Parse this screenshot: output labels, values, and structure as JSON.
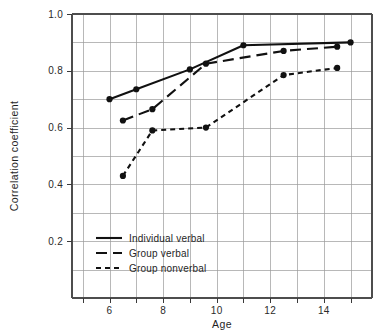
{
  "chart_data": {
    "type": "line",
    "title": "",
    "xlabel": "Age",
    "ylabel": "Correlation coefficient",
    "xlim": [
      4.6,
      15.8
    ],
    "ylim": [
      0.0,
      1.0
    ],
    "grid": true,
    "x_major_ticks": [
      6,
      8,
      10,
      12,
      14
    ],
    "x_major_tick_labels": [
      "6",
      "8",
      "10",
      "12",
      "14"
    ],
    "x_gridlines": [
      5,
      6,
      7,
      8,
      9,
      10,
      11,
      12,
      13,
      14,
      15
    ],
    "y_major_ticks": [
      0.2,
      0.4,
      0.6,
      0.8,
      1.0
    ],
    "y_major_tick_labels": [
      "0.2",
      "0.4",
      "0.6",
      "0.8",
      "1.0"
    ],
    "y_gridlines": [
      0.1,
      0.2,
      0.3,
      0.4,
      0.5,
      0.6,
      0.7,
      0.8,
      0.9,
      1.0
    ],
    "legend_position": "lower left",
    "series": [
      {
        "name": "Individual verbal",
        "style": "solid",
        "x": [
          6.0,
          7.0,
          9.0,
          11.0,
          15.0
        ],
        "y": [
          0.7,
          0.735,
          0.805,
          0.89,
          0.9
        ]
      },
      {
        "name": "Group verbal",
        "style": "long-dash",
        "x": [
          6.5,
          7.6,
          9.6,
          12.5,
          14.5
        ],
        "y": [
          0.625,
          0.665,
          0.825,
          0.87,
          0.885
        ]
      },
      {
        "name": "Group nonverbal",
        "style": "short-dash",
        "x": [
          6.5,
          7.6,
          9.6,
          12.5,
          14.5
        ],
        "y": [
          0.43,
          0.59,
          0.6,
          0.785,
          0.81
        ]
      }
    ]
  },
  "legend": {
    "items": [
      {
        "label": "Individual verbal",
        "style": "solid"
      },
      {
        "label": "Group verbal",
        "style": "long-dash"
      },
      {
        "label": "Group nonverbal",
        "style": "short-dash"
      }
    ]
  },
  "colors": {
    "series": "#111111",
    "grid": "#9a9a9a",
    "frame": "#4d4d4d",
    "text": "#1f1f1f",
    "background": "#ffffff"
  }
}
